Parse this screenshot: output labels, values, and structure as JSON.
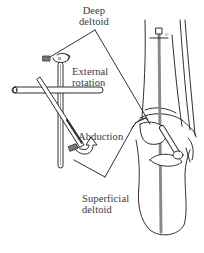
{
  "figure": {
    "labels": {
      "deep_deltoid": [
        "Deep",
        "deltoid"
      ],
      "external_rotation": [
        "External",
        "rotation"
      ],
      "abduction": [
        "Abduction"
      ],
      "superficial_deltoid": [
        "Superficial",
        "deltoid"
      ]
    }
  },
  "colors": {
    "line": "#1a1a1a",
    "text": "#3a3a3a",
    "background": "#ffffff",
    "hatch": "#555555"
  }
}
